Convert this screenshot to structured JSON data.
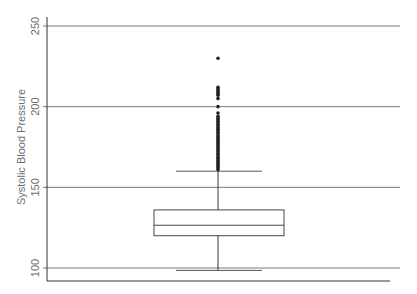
{
  "chart_data": {
    "type": "box",
    "title": "",
    "xlabel": "",
    "ylabel": "Systolic Blood Pressure",
    "ylim": [
      96,
      256
    ],
    "yticks": [
      100,
      150,
      200,
      250
    ],
    "ytick_labels": [
      "100",
      "150",
      "200",
      "250"
    ],
    "grid": true,
    "box": {
      "q1": 120,
      "median": 126.5,
      "q3": 136,
      "whisker_low": 98.5,
      "whisker_high": 160
    },
    "outliers": [
      161,
      162,
      163,
      164,
      165,
      166,
      167,
      168,
      169,
      170,
      171,
      172,
      173,
      174,
      175,
      176,
      177,
      178,
      179,
      180,
      181,
      182,
      183,
      184,
      185,
      186,
      187,
      188,
      189,
      190,
      191,
      192,
      193,
      194,
      196,
      200,
      205,
      207,
      208,
      209,
      210,
      211,
      212,
      230
    ]
  }
}
